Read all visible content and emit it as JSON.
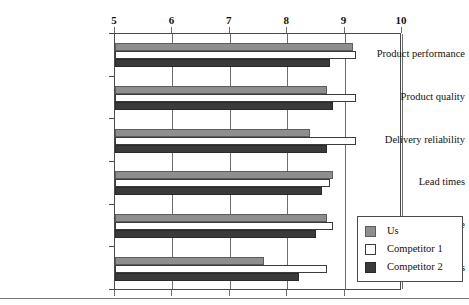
{
  "chart_data": {
    "type": "bar",
    "orientation": "horizontal",
    "title": "",
    "xlabel": "",
    "ylabel": "",
    "xlim": [
      5,
      10
    ],
    "xticks": [
      5,
      6,
      7,
      8,
      9,
      10
    ],
    "xtick_labels": [
      "5",
      "6",
      "7",
      "8",
      "9",
      "10"
    ],
    "grid": true,
    "grid_axis": "x",
    "legend_position": "bottom-right",
    "categories": [
      "Product performance",
      "Product quality",
      "Delivery reliability",
      "Lead times",
      "Technical service",
      "Responsiveness"
    ],
    "series": [
      {
        "name": "Us",
        "color": "#8e8e8e",
        "values": [
          9.15,
          8.7,
          8.4,
          8.8,
          8.7,
          7.6
        ]
      },
      {
        "name": "Competitor 1",
        "color": "#ffffff",
        "values": [
          9.2,
          9.2,
          9.2,
          8.75,
          8.8,
          8.7
        ]
      },
      {
        "name": "Competitor 2",
        "color": "#3a3a3a",
        "values": [
          8.75,
          8.8,
          8.7,
          8.6,
          8.5,
          8.2
        ]
      }
    ]
  },
  "legend": {
    "items": [
      {
        "label": "Us",
        "swatch": "us"
      },
      {
        "label": "Competitor 1",
        "swatch": "c1"
      },
      {
        "label": "Competitor 2",
        "swatch": "c2"
      }
    ]
  }
}
